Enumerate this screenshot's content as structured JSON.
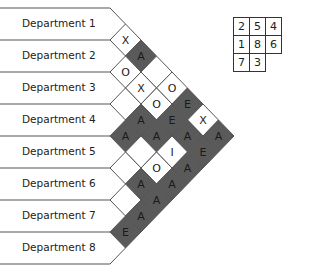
{
  "departments": [
    "Department 1",
    "Department 2",
    "Department 3",
    "Department 4",
    "Department 5",
    "Department 6",
    "Department 7",
    "Department 8"
  ],
  "relationships": [
    {
      "from": 1,
      "to": 2,
      "code": "X"
    },
    {
      "from": 1,
      "to": 3,
      "code": "A"
    },
    {
      "from": 1,
      "to": 4,
      "code": ""
    },
    {
      "from": 1,
      "to": 5,
      "code": "O"
    },
    {
      "from": 1,
      "to": 6,
      "code": "E"
    },
    {
      "from": 1,
      "to": 7,
      "code": "X"
    },
    {
      "from": 1,
      "to": 8,
      "code": "A"
    },
    {
      "from": 2,
      "to": 3,
      "code": "O"
    },
    {
      "from": 2,
      "to": 4,
      "code": "X"
    },
    {
      "from": 2,
      "to": 5,
      "code": "O"
    },
    {
      "from": 2,
      "to": 6,
      "code": "E"
    },
    {
      "from": 2,
      "to": 7,
      "code": "A"
    },
    {
      "from": 2,
      "to": 8,
      "code": "E"
    },
    {
      "from": 3,
      "to": 4,
      "code": ""
    },
    {
      "from": 3,
      "to": 5,
      "code": "A"
    },
    {
      "from": 3,
      "to": 6,
      "code": "A"
    },
    {
      "from": 3,
      "to": 7,
      "code": "I"
    },
    {
      "from": 3,
      "to": 8,
      "code": "A"
    },
    {
      "from": 4,
      "to": 5,
      "code": "A"
    },
    {
      "from": 4,
      "to": 6,
      "code": ""
    },
    {
      "from": 4,
      "to": 7,
      "code": "O"
    },
    {
      "from": 4,
      "to": 8,
      "code": "A"
    },
    {
      "from": 5,
      "to": 6,
      "code": ""
    },
    {
      "from": 5,
      "to": 7,
      "code": "A"
    },
    {
      "from": 5,
      "to": 8,
      "code": "A"
    },
    {
      "from": 6,
      "to": 7,
      "code": ""
    },
    {
      "from": 6,
      "to": 8,
      "code": "A"
    },
    {
      "from": 7,
      "to": 8,
      "code": "E"
    }
  ],
  "shaded_codes": [
    "A",
    "E"
  ],
  "colors": {
    "shaded_fill": "#5a5a5a",
    "plain_fill": "#ffffff",
    "line": "#555555",
    "text": "#222222"
  },
  "layout_grid": [
    [
      "2",
      "5",
      "4"
    ],
    [
      "1",
      "8",
      "6"
    ],
    [
      "7",
      "3",
      ""
    ]
  ]
}
